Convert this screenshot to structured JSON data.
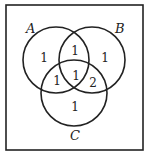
{
  "diagram": {
    "type": "venn-3",
    "sets": [
      {
        "name": "A",
        "label": "A"
      },
      {
        "name": "B",
        "label": "B"
      },
      {
        "name": "C",
        "label": "C"
      }
    ],
    "regions": {
      "A_only": "1",
      "B_only": "1",
      "C_only": "1",
      "A_and_B_only": "1",
      "A_and_C_only": "1",
      "B_and_C_only": "2",
      "A_and_B_and_C": "1"
    }
  }
}
